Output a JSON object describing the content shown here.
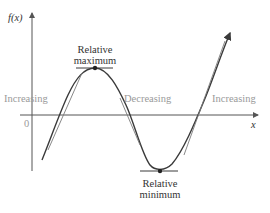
{
  "diagram": {
    "y_axis_label": "f(x)",
    "x_axis_label": "x",
    "origin_label": "0",
    "regions": [
      {
        "label": "Increasing"
      },
      {
        "label": "Decreasing"
      },
      {
        "label": "Increasing"
      }
    ],
    "extrema": {
      "maximum": {
        "line1": "Relative",
        "line2": "maximum"
      },
      "minimum": {
        "line1": "Relative",
        "line2": "minimum"
      }
    },
    "colors": {
      "curve": "#3a3a3a",
      "axes": "#555555",
      "tangent": "#7a7a7a",
      "region_text": "#9a9a9a",
      "label_text": "#333333"
    }
  }
}
